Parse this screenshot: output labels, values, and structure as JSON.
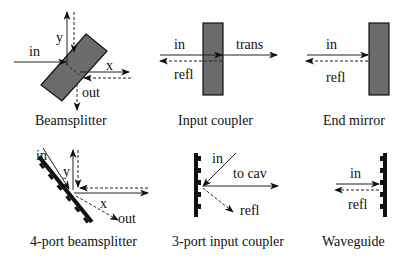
{
  "figure": {
    "panels": [
      {
        "id": "beamsplitter",
        "caption": "Beamsplitter",
        "labels": {
          "in": "in",
          "y": "y",
          "x": "x",
          "out": "out"
        }
      },
      {
        "id": "input-coupler",
        "caption": "Input coupler",
        "labels": {
          "in": "in",
          "trans": "trans",
          "refl": "refl"
        }
      },
      {
        "id": "end-mirror",
        "caption": "End mirror",
        "labels": {
          "in": "in",
          "refl": "refl"
        }
      },
      {
        "id": "four-port-beamsplitter",
        "caption": "4-port beamsplitter",
        "labels": {
          "in": "in",
          "y": "y",
          "x": "x",
          "out": "out"
        }
      },
      {
        "id": "three-port-input-coupler",
        "caption": "3-port input coupler",
        "labels": {
          "in": "in",
          "to_cav": "to cav",
          "refl": "refl"
        }
      },
      {
        "id": "waveguide",
        "caption": "Waveguide",
        "labels": {
          "in": "in",
          "refl": "refl"
        }
      }
    ],
    "colors": {
      "mirror_fill": "#6b6b6b",
      "grating_fill": "#111111",
      "line": "#222222"
    }
  }
}
